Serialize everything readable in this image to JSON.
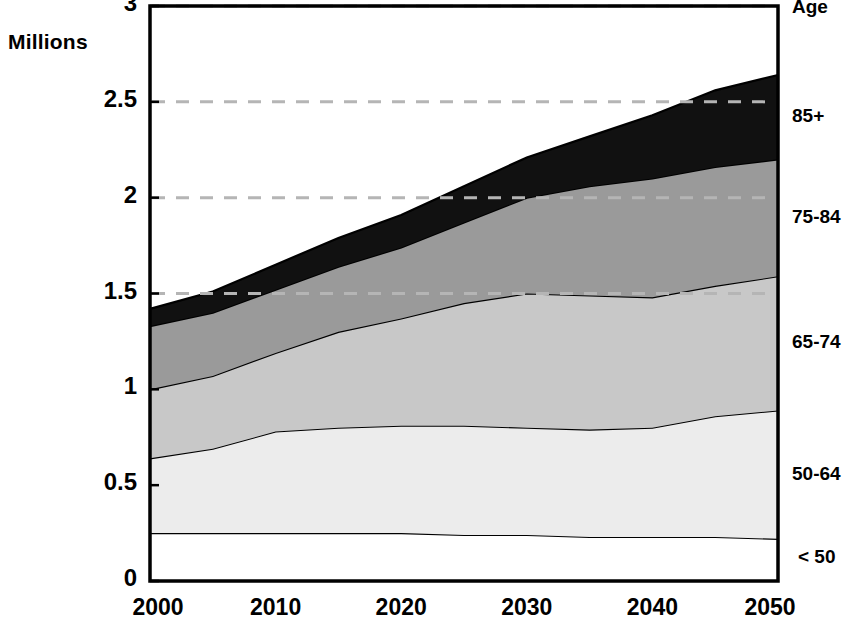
{
  "chart_data": {
    "type": "area",
    "title": "",
    "subtitle": "",
    "ylabel": "Millions",
    "xlabel": "",
    "stacked": true,
    "grid": true,
    "grid_style": "dashed horizontal",
    "legend_position": "right",
    "legend_header": "Age",
    "ylim": [
      0,
      3
    ],
    "xlim": [
      2000,
      2050
    ],
    "y_ticks": [
      "0",
      "0.5",
      "1",
      "1.5",
      "2",
      "2.5",
      "3"
    ],
    "y_tick_values": [
      0,
      0.5,
      1,
      1.5,
      2,
      2.5,
      3
    ],
    "x_ticks": [
      "2000",
      "2010",
      "2020",
      "2030",
      "2040",
      "2050"
    ],
    "x_tick_values": [
      2000,
      2010,
      2020,
      2030,
      2040,
      2050
    ],
    "x": [
      2000,
      2005,
      2010,
      2015,
      2020,
      2025,
      2030,
      2035,
      2040,
      2045,
      2050
    ],
    "series": [
      {
        "name": "< 50",
        "color": "#ffffff",
        "values": [
          0.25,
          0.25,
          0.25,
          0.25,
          0.25,
          0.24,
          0.24,
          0.23,
          0.23,
          0.23,
          0.22
        ]
      },
      {
        "name": "50-64",
        "color": "#ececec",
        "values": [
          0.39,
          0.44,
          0.53,
          0.55,
          0.56,
          0.57,
          0.56,
          0.56,
          0.57,
          0.63,
          0.67
        ]
      },
      {
        "name": "65-74",
        "color": "#c8c8c8",
        "values": [
          0.36,
          0.38,
          0.41,
          0.5,
          0.56,
          0.64,
          0.7,
          0.7,
          0.68,
          0.68,
          0.7
        ]
      },
      {
        "name": "75-84",
        "color": "#9a9a9a",
        "values": [
          0.33,
          0.33,
          0.33,
          0.34,
          0.37,
          0.42,
          0.5,
          0.57,
          0.62,
          0.62,
          0.61
        ]
      },
      {
        "name": "85+",
        "color": "#111111",
        "values": [
          0.09,
          0.11,
          0.13,
          0.15,
          0.17,
          0.19,
          0.21,
          0.26,
          0.33,
          0.4,
          0.44
        ]
      }
    ],
    "cumulative_totals": [
      1.32,
      1.41,
      1.55,
      1.69,
      1.81,
      1.96,
      2.11,
      2.22,
      2.31,
      2.46,
      2.64
    ]
  },
  "legend": {
    "header": "Age",
    "items": [
      {
        "label": "85+"
      },
      {
        "label": "75-84"
      },
      {
        "label": "65-74"
      },
      {
        "label": "50-64"
      },
      {
        "label": "< 50"
      }
    ]
  },
  "axes": {
    "y_title": "Millions",
    "y_labels": [
      "3",
      "2.5",
      "2",
      "1.5",
      "1",
      "0.5",
      "0"
    ],
    "x_labels": [
      "2000",
      "2010",
      "2020",
      "2030",
      "2040",
      "2050"
    ]
  },
  "colors": {
    "band_85_plus": "#111111",
    "band_75_84": "#9a9a9a",
    "band_65_74": "#c8c8c8",
    "band_50_64": "#ececec",
    "band_under_50": "#ffffff",
    "gridline": "#b5b5b5",
    "frame": "#000000",
    "text": "#000000"
  }
}
